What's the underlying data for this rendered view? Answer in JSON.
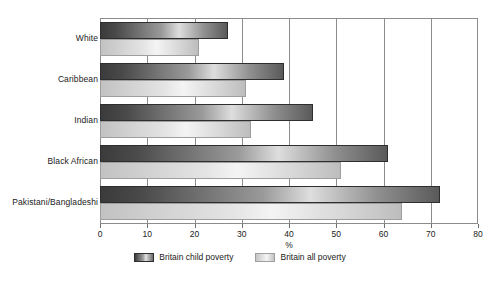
{
  "chart_data": {
    "type": "bar",
    "orientation": "horizontal",
    "title": "",
    "xlabel": "%",
    "ylabel": "",
    "xlim": [
      0,
      80
    ],
    "xticks": [
      0,
      10,
      20,
      30,
      40,
      50,
      60,
      70,
      80
    ],
    "xtick_labels": [
      "0",
      "10",
      "20",
      "30",
      "40",
      "50",
      "60",
      "70",
      "80"
    ],
    "grid": true,
    "grid_axis": "x",
    "legend_position": "bottom-center",
    "categories": [
      "White",
      "Caribbean",
      "Indian",
      "Black African",
      "Pakistani/Bangladeshi"
    ],
    "series": [
      {
        "name": "Britain child poverty",
        "color": "#4a4a4a",
        "values": [
          27,
          39,
          45,
          61,
          72
        ]
      },
      {
        "name": "Britain all poverty",
        "color": "#dcdcdc",
        "values": [
          21,
          31,
          32,
          51,
          64
        ]
      }
    ]
  },
  "axis": {
    "x_title": "%"
  },
  "legend": {
    "items": [
      {
        "label": "Britain child poverty",
        "swatch": "dark-gradient-swatch"
      },
      {
        "label": "Britain all poverty",
        "swatch": "light-gradient-swatch"
      }
    ]
  },
  "colors": {
    "frame": "#8c8c8c",
    "gridline": "#8c8c8c",
    "child_bar_dark": "#3b3b3b",
    "child_bar_light": "#dedede",
    "all_bar_light": "#f4f4f4",
    "all_bar_mid": "#c2c2c2",
    "text": "#1a1a1a",
    "background": "#ffffff"
  }
}
